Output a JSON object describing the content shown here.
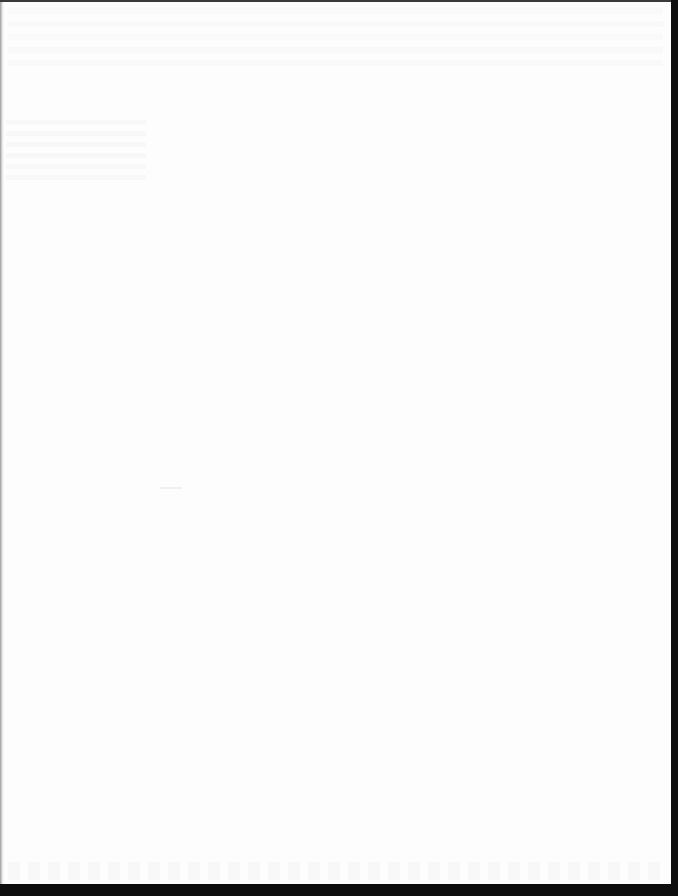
{
  "document": {
    "type": "scanned page",
    "description": "Blank page",
    "content": ""
  },
  "colors": {
    "paper": "#fdfdfd",
    "scanner_border": "#0e0e0e"
  }
}
